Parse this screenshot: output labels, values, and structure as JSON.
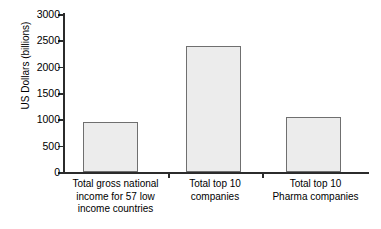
{
  "chart_data": {
    "type": "bar",
    "title": "",
    "subtitle": "",
    "xlabel": "",
    "ylabel": "US Dollars (billions)",
    "categories": [
      "Total gross national income for 57 low income countries",
      "Total top 10 companies",
      "Total top 10 Pharma companies"
    ],
    "category_lines": [
      [
        "Total gross national",
        "income for 57 low",
        "income countries"
      ],
      [
        "Total top 10",
        "companies"
      ],
      [
        "Total top 10",
        "Pharma companies"
      ]
    ],
    "values": [
      950,
      2400,
      1050
    ],
    "ylim": [
      0,
      3000
    ],
    "yticks": [
      0,
      500,
      1000,
      1500,
      2000,
      2500,
      3000
    ],
    "ytick_labels": [
      "0",
      "500",
      "1000",
      "1500",
      "2000",
      "2500",
      "3000"
    ],
    "grid": false,
    "legend": false,
    "legend_position": "none",
    "bar_fill_color": "#ececec",
    "bar_edge_color": "#6f6f6f",
    "axis_color": "#2b2b2b",
    "background_color": "#ffffff"
  }
}
